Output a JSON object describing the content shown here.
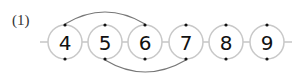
{
  "problem": {
    "label": "(1)",
    "nodes": [
      {
        "value": "4",
        "cx": 65
      },
      {
        "value": "5",
        "cx": 105
      },
      {
        "value": "6",
        "cx": 145
      },
      {
        "value": "7",
        "cx": 186
      },
      {
        "value": "8",
        "cx": 226
      },
      {
        "value": "9",
        "cx": 267
      }
    ],
    "arcs": [
      {
        "from": "4",
        "to": "6",
        "side": "top"
      },
      {
        "from": "5",
        "to": "7",
        "side": "bottom"
      }
    ],
    "colors": {
      "circle": "#c8c8c8",
      "line": "#aaaaaa",
      "arc": "#777777",
      "dot": "#111111"
    }
  }
}
